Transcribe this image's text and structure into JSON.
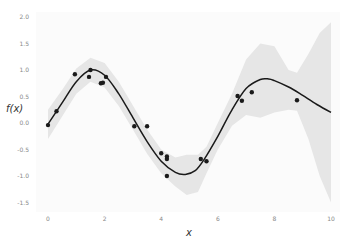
{
  "chart_data": {
    "type": "line",
    "title": "",
    "xlabel": "x",
    "ylabel": "f(x)",
    "xlim": [
      0,
      10
    ],
    "ylim": [
      -1.6,
      2.05
    ],
    "grid": false,
    "legend": null,
    "x_ticks": [
      "0",
      "2",
      "4",
      "6",
      "8",
      "10"
    ],
    "y_ticks": [
      "2.0",
      "1.5",
      "1.0",
      "0.5",
      "0.0",
      "-0.5",
      "-1.0",
      "-1.5"
    ],
    "colors": {
      "mean_line": "#1a1a1a",
      "band": "#e6e6e6",
      "points": "#1a1a1a",
      "background": "#fbfbfb",
      "tick_text": "#888888"
    },
    "series": [
      {
        "name": "observations",
        "type": "scatter",
        "x": [
          0.0,
          0.3,
          0.95,
          1.45,
          1.5,
          1.87,
          1.94,
          2.05,
          3.05,
          3.5,
          4.0,
          4.2,
          4.2,
          4.2,
          5.4,
          5.6,
          6.7,
          6.85,
          7.2,
          8.8
        ],
        "y": [
          -0.04,
          0.22,
          0.92,
          0.87,
          1.0,
          0.75,
          0.76,
          0.87,
          -0.06,
          -0.06,
          -0.57,
          -0.63,
          -0.68,
          -1.0,
          -0.68,
          -0.72,
          0.51,
          0.42,
          0.58,
          0.43
        ]
      },
      {
        "name": "GP mean",
        "type": "line",
        "x": [
          0,
          0.5,
          1,
          1.5,
          2,
          2.5,
          3,
          3.5,
          4,
          4.5,
          4.85,
          5.2,
          5.5,
          6,
          6.5,
          7,
          7.5,
          7.8,
          8,
          8.5,
          9,
          9.5,
          10
        ],
        "y": [
          -0.02,
          0.38,
          0.78,
          1.0,
          0.9,
          0.55,
          0.1,
          -0.35,
          -0.72,
          -0.93,
          -0.97,
          -0.9,
          -0.7,
          -0.25,
          0.25,
          0.65,
          0.82,
          0.83,
          0.8,
          0.68,
          0.52,
          0.35,
          0.2
        ]
      },
      {
        "name": "confidence band",
        "type": "area",
        "x": [
          0,
          0.5,
          1,
          1.5,
          2,
          2.5,
          3,
          3.5,
          4,
          4.5,
          4.9,
          5.3,
          5.6,
          6,
          6.5,
          7,
          7.5,
          8,
          8.5,
          8.8,
          9.2,
          9.6,
          10
        ],
        "upper": [
          0.25,
          0.62,
          1.03,
          1.23,
          1.13,
          0.78,
          0.33,
          -0.12,
          -0.5,
          -0.65,
          -0.6,
          -0.6,
          -0.45,
          0.0,
          0.55,
          1.2,
          1.5,
          1.45,
          1.0,
          0.95,
          1.3,
          1.7,
          1.9
        ],
        "lower": [
          -0.3,
          0.12,
          0.55,
          0.78,
          0.67,
          0.32,
          -0.12,
          -0.58,
          -0.95,
          -1.2,
          -1.36,
          -1.3,
          -0.95,
          -0.5,
          -0.05,
          0.15,
          0.1,
          0.2,
          0.25,
          0.23,
          -0.3,
          -1.0,
          -1.5
        ]
      }
    ]
  }
}
